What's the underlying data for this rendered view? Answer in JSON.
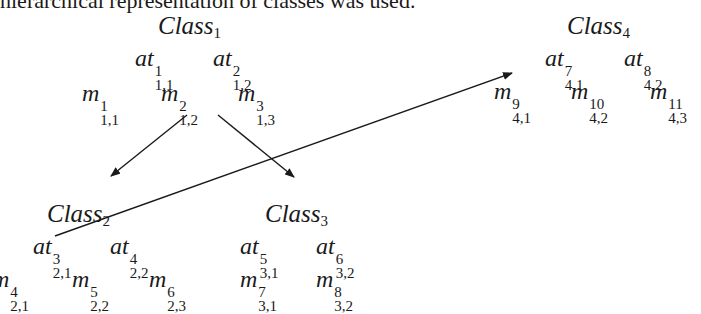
{
  "caption": "hierarchical representation of classes was used.",
  "classes": [
    {
      "id": "class1",
      "name": "Class",
      "index": "1",
      "attributes": [
        {
          "base": "at",
          "sup": "1",
          "sub": "1,1"
        },
        {
          "base": "at",
          "sup": "2",
          "sub": "1,2"
        }
      ],
      "methods": [
        {
          "base": "m",
          "sup": "1",
          "sub": "1,1"
        },
        {
          "base": "m",
          "sup": "2",
          "sub": "1,2"
        },
        {
          "base": "m",
          "sup": "3",
          "sub": "1,3"
        }
      ]
    },
    {
      "id": "class2",
      "name": "Class",
      "index": "2",
      "attributes": [
        {
          "base": "at",
          "sup": "3",
          "sub": "2,1"
        },
        {
          "base": "at",
          "sup": "4",
          "sub": "2,2"
        }
      ],
      "methods": [
        {
          "base": "m",
          "sup": "4",
          "sub": "2,1"
        },
        {
          "base": "m",
          "sup": "5",
          "sub": "2,2"
        },
        {
          "base": "m",
          "sup": "6",
          "sub": "2,3"
        }
      ]
    },
    {
      "id": "class3",
      "name": "Class",
      "index": "3",
      "attributes": [
        {
          "base": "at",
          "sup": "5",
          "sub": "3,1"
        },
        {
          "base": "at",
          "sup": "6",
          "sub": "3,2"
        }
      ],
      "methods": [
        {
          "base": "m",
          "sup": "7",
          "sub": "3,1"
        },
        {
          "base": "m",
          "sup": "8",
          "sub": "3,2"
        }
      ]
    },
    {
      "id": "class4",
      "name": "Class",
      "index": "4",
      "attributes": [
        {
          "base": "at",
          "sup": "7",
          "sub": "4,1"
        },
        {
          "base": "at",
          "sup": "8",
          "sub": "4,2"
        }
      ],
      "methods": [
        {
          "base": "m",
          "sup": "9",
          "sub": "4,1"
        },
        {
          "base": "m",
          "sup": "10",
          "sub": "4,2"
        },
        {
          "base": "m",
          "sup": "11",
          "sub": "4,3"
        }
      ]
    }
  ],
  "edges": [
    {
      "from": "class1",
      "to": "class2",
      "type": "inheritance-arrow"
    },
    {
      "from": "class1",
      "to": "class3",
      "type": "inheritance-arrow"
    },
    {
      "from": "class2",
      "to": "class4",
      "type": "association-arrow"
    }
  ],
  "colors": {
    "ink": "#1a1a1a",
    "background": "#ffffff"
  }
}
